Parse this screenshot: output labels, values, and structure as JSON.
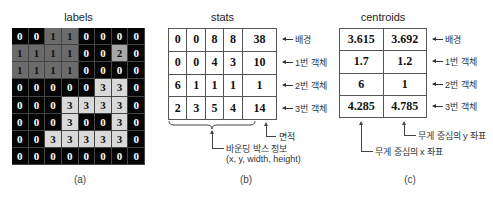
{
  "panels": {
    "a": {
      "title": "labels",
      "caption": "(a)",
      "grid": [
        [
          0,
          0,
          1,
          1,
          0,
          0,
          0,
          0
        ],
        [
          1,
          1,
          1,
          1,
          0,
          0,
          2,
          0
        ],
        [
          1,
          1,
          1,
          1,
          0,
          0,
          0,
          0
        ],
        [
          0,
          0,
          0,
          0,
          0,
          3,
          3,
          0
        ],
        [
          0,
          0,
          0,
          3,
          3,
          3,
          3,
          0
        ],
        [
          0,
          0,
          0,
          3,
          0,
          0,
          3,
          0
        ],
        [
          0,
          0,
          3,
          3,
          3,
          3,
          3,
          0
        ],
        [
          0,
          0,
          0,
          0,
          0,
          0,
          0,
          0
        ]
      ],
      "label_colors": {
        "0": {
          "bg": "#050505",
          "fg": "#ffffff"
        },
        "1": {
          "bg": "#6b6b6b",
          "fg": "#111111"
        },
        "2": {
          "bg": "#a8a8a8",
          "fg": "#111111"
        },
        "3": {
          "bg": "#d9d9d9",
          "fg": "#111111"
        }
      }
    },
    "b": {
      "title": "stats",
      "caption": "(b)",
      "rows": [
        [
          "0",
          "0",
          "8",
          "8",
          "38"
        ],
        [
          "0",
          "0",
          "4",
          "3",
          "10"
        ],
        [
          "6",
          "1",
          "1",
          "1",
          "1"
        ],
        [
          "2",
          "3",
          "5",
          "4",
          "14"
        ]
      ],
      "row_labels": [
        "배경",
        "1번 객체",
        "2번 객체",
        "3번 객체"
      ],
      "area_note": "면적",
      "bbox_note_line1": "바운딩 박스 정보",
      "bbox_note_line2": "(x, y, width, height)"
    },
    "c": {
      "title": "centroids",
      "caption": "(c)",
      "rows": [
        [
          "3.615",
          "3.692"
        ],
        [
          "1.7",
          "1.2"
        ],
        [
          "6",
          "1"
        ],
        [
          "4.285",
          "4.785"
        ]
      ],
      "row_labels": [
        "배경",
        "1번 객체",
        "2번 객체",
        "3번 객체"
      ],
      "y_note": "무게 중심의 y 좌표",
      "x_note": "무게 중심의 x 좌표"
    }
  }
}
